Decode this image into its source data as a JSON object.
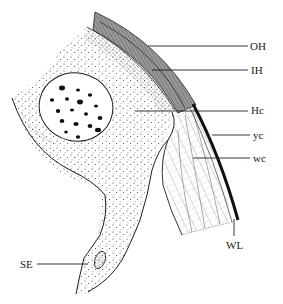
{
  "figure": {
    "type": "anatomical cross-section line drawing",
    "background": "#ffffff",
    "ink_color": "#1e1e1e",
    "band_color": "#8a8a8a"
  },
  "labels": [
    {
      "id": "OH",
      "text": "OH",
      "x": 250,
      "y": 41,
      "line_from": [
        148,
        46
      ],
      "line_to": [
        248,
        46
      ]
    },
    {
      "id": "IH",
      "text": "IH",
      "x": 251,
      "y": 65,
      "line_from": [
        152,
        70
      ],
      "line_to": [
        248,
        70
      ]
    },
    {
      "id": "Hc",
      "text": "Hc",
      "x": 251,
      "y": 105,
      "line_from": [
        135,
        111
      ],
      "line_to": [
        248,
        111
      ]
    },
    {
      "id": "yc",
      "text": "yc",
      "x": 253,
      "y": 130,
      "line_from": [
        212,
        135
      ],
      "line_to": [
        250,
        135
      ]
    },
    {
      "id": "wc",
      "text": "wc",
      "x": 253,
      "y": 153,
      "line_from": [
        193,
        158
      ],
      "line_to": [
        250,
        158
      ]
    },
    {
      "id": "WL",
      "text": "WL",
      "x": 226,
      "y": 240,
      "line_from": [
        234,
        219
      ],
      "line_to": [
        234,
        236
      ]
    },
    {
      "id": "SE",
      "text": "SE",
      "x": 20,
      "y": 259,
      "line_from": [
        37,
        264
      ],
      "line_to": [
        88,
        264
      ]
    }
  ]
}
